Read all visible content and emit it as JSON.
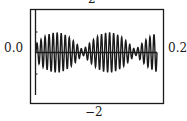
{
  "chart_data": {
    "type": "line",
    "title": "",
    "xlabel": "",
    "ylabel": "",
    "labels": {
      "top": "2",
      "bottom": "−2",
      "left": "0.0",
      "right": "0.2"
    },
    "x_range": [
      0.0,
      0.2
    ],
    "y_range": [
      -2,
      2
    ],
    "grid": false,
    "legend": null,
    "series": [
      {
        "name": "beat waveform",
        "description": "Amplitude-modulated oscillation (beats): envelope maxima near x=0.05 and x=0.12, near-zero nodes around x=0.085 and x=0.16, rising again at x=0.2",
        "carrier_cycles": 30,
        "envelope_cycles": 2.3,
        "peak_amplitude": 1.3,
        "color": "#1a1a1a"
      }
    ]
  }
}
